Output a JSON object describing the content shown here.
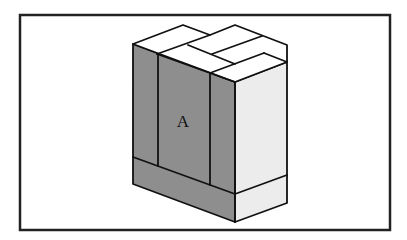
{
  "diagram": {
    "type": "isometric-block-stack",
    "label": "A",
    "colors": {
      "background": "#ffffff",
      "frame": "#222222",
      "stroke": "#111111",
      "left_face": "#8e8e8e",
      "right_face": "#ececec",
      "top_face": "#ffffff"
    },
    "frame": {
      "x": 19,
      "y": 14,
      "width": 372,
      "height": 217
    }
  }
}
